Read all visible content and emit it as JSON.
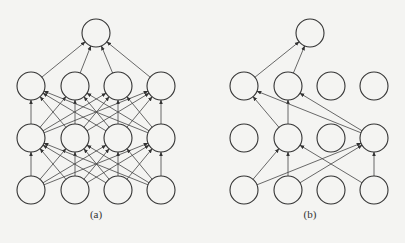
{
  "diagram": {
    "node_radius": 14,
    "colors": {
      "stroke": "#333333",
      "background": "#f4f4f2"
    },
    "panels": [
      {
        "caption": "(a)",
        "caption_pos": [
          96,
          218
        ],
        "layers": [
          {
            "name": "input",
            "y": 190,
            "xs": [
              31,
              75,
              118,
              161
            ],
            "active": [
              true,
              true,
              true,
              true
            ]
          },
          {
            "name": "hidden1",
            "y": 138,
            "xs": [
              31,
              75,
              118,
              161
            ],
            "active": [
              true,
              true,
              true,
              true
            ]
          },
          {
            "name": "hidden2",
            "y": 86,
            "xs": [
              31,
              75,
              118,
              161
            ],
            "active": [
              true,
              true,
              true,
              true
            ]
          },
          {
            "name": "output",
            "y": 33,
            "xs": [
              96
            ],
            "active": [
              true
            ]
          }
        ],
        "edges": "fully-connected"
      },
      {
        "caption": "(b)",
        "caption_pos": [
          310,
          218
        ],
        "layers": [
          {
            "name": "input",
            "y": 190,
            "xs": [
              244,
              288,
              331,
              374
            ],
            "active": [
              true,
              true,
              false,
              true
            ]
          },
          {
            "name": "hidden1",
            "y": 138,
            "xs": [
              244,
              288,
              331,
              374
            ],
            "active": [
              false,
              true,
              false,
              true
            ]
          },
          {
            "name": "hidden2",
            "y": 86,
            "xs": [
              244,
              288,
              331,
              374
            ],
            "active": [
              true,
              true,
              false,
              false
            ]
          },
          {
            "name": "output",
            "y": 33,
            "xs": [
              310
            ],
            "active": [
              true
            ]
          }
        ],
        "edges": "active-only"
      }
    ]
  }
}
